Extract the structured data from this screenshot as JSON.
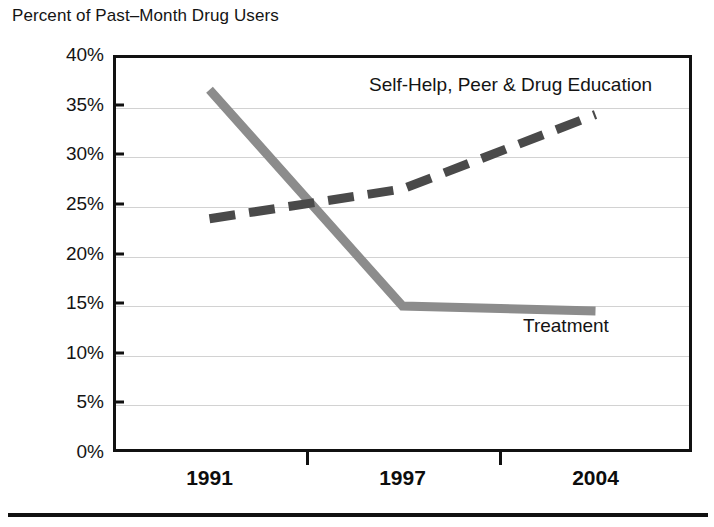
{
  "chart_data": {
    "type": "line",
    "title": "Percent of Past–Month Drug Users",
    "xlabel": "",
    "ylabel": "",
    "categories": [
      "1991",
      "1997",
      "2004"
    ],
    "ylim": [
      0,
      40
    ],
    "ytick_values": [
      40,
      35,
      30,
      25,
      20,
      15,
      10,
      5,
      0
    ],
    "ytick_labels": [
      "40%",
      "35%",
      "30%",
      "25%",
      "20%",
      "15%",
      "10%",
      "5%",
      "0%"
    ],
    "grid": true,
    "legend_position": "inline-annotations",
    "series": [
      {
        "name": "Self-Help, Peer & Drug Education",
        "values": [
          23.5,
          26.5,
          34.0
        ],
        "style": "dashed",
        "color": "#4a4a4a"
      },
      {
        "name": "Treatment",
        "values": [
          36.5,
          14.7,
          14.2
        ],
        "style": "solid",
        "color": "#8c8c8c"
      }
    ],
    "annotations": [
      {
        "text": "Self-Help, Peer & Drug Education",
        "series": "Self-Help, Peer & Drug Education"
      },
      {
        "text": "Treatment",
        "series": "Treatment"
      }
    ]
  },
  "colors": {
    "axis": "#111111",
    "gridline": "#d2d2d2",
    "treatment_line": "#8c8c8c",
    "selfhelp_line": "#4a4a4a",
    "text": "#141414",
    "background": "#ffffff"
  }
}
